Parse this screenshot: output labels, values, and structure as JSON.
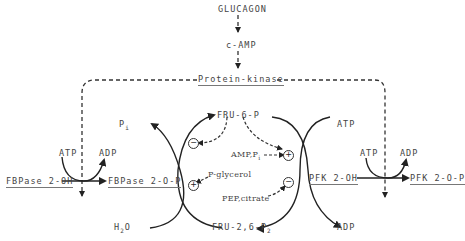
{
  "diagram": {
    "signal": {
      "hormone": "GLUCAGON",
      "second_messenger": "c-AMP",
      "kinase": "Protein-kinase"
    },
    "left_enzyme": {
      "inactive": "FBPase 2-OH",
      "active": "FBPase 2-O-P",
      "cofactor_in": "ATP",
      "cofactor_out": "ADP"
    },
    "right_enzyme": {
      "inactive": "PFK 2-OH",
      "active": "PFK 2-O-P",
      "cofactor_in": "ATP",
      "cofactor_out": "ADP"
    },
    "cycle": {
      "top_metabolite": "FRU-6-P",
      "bottom_metabolite_main": "FRU-2,6-P",
      "bottom_metabolite_sub": "2",
      "left_top_main": "P",
      "left_top_sub": "i",
      "left_bottom_main": "H",
      "left_bottom_sub": "2",
      "left_bottom_tail": "O",
      "right_top": "ATP",
      "right_bottom": "ADP"
    },
    "effectors": {
      "amp_pi_main": "AMP,P",
      "amp_pi_sub": "i",
      "p_glycerol": "P-glycerol",
      "pep_citrate": "PEP,citrate"
    },
    "signs": {
      "left_upper": "−",
      "right_upper": "+",
      "left_lower": "+",
      "right_lower": "−"
    }
  }
}
